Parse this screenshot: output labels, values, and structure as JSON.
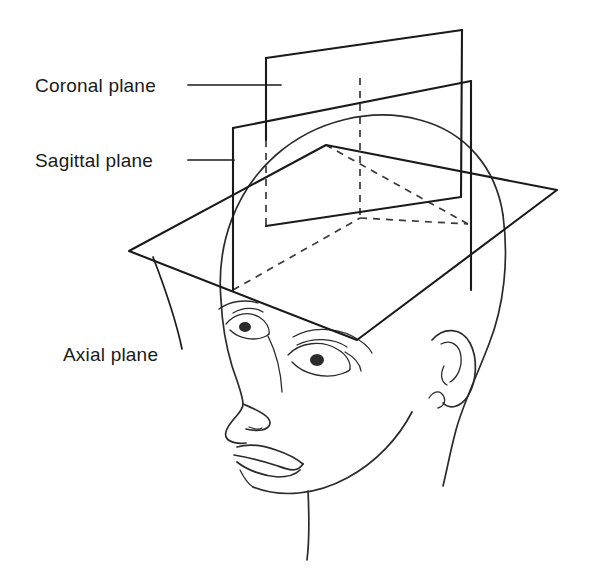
{
  "figure": {
    "background_color": "#ffffff",
    "line_color": "#1a1a1a",
    "hidden_line_color": "#3a3a3a",
    "width": 601,
    "height": 584
  },
  "labels": {
    "coronal": "Coronal plane",
    "sagittal": "Sagittal plane",
    "axial": "Axial plane"
  },
  "planes": [
    {
      "key": "coronal",
      "name": "Coronal plane",
      "orientation": "vertical, divides front from back",
      "corners": "266,58 462,30 461,197 266,226"
    },
    {
      "key": "sagittal",
      "name": "Sagittal plane",
      "orientation": "vertical, divides left from right",
      "corners": "233,128 471,81 471,290 233,290"
    },
    {
      "key": "axial",
      "name": "Axial plane",
      "orientation": "horizontal, divides superior from inferior",
      "corners": "129,251 357,340 557,190 326,145"
    }
  ],
  "subject": {
    "description": "Line drawing of a human head in three-quarter view facing left",
    "features": [
      "skull-outline",
      "left-eye",
      "right-eye",
      "eyebrow",
      "nose",
      "lips",
      "ear",
      "jaw",
      "neck"
    ]
  }
}
